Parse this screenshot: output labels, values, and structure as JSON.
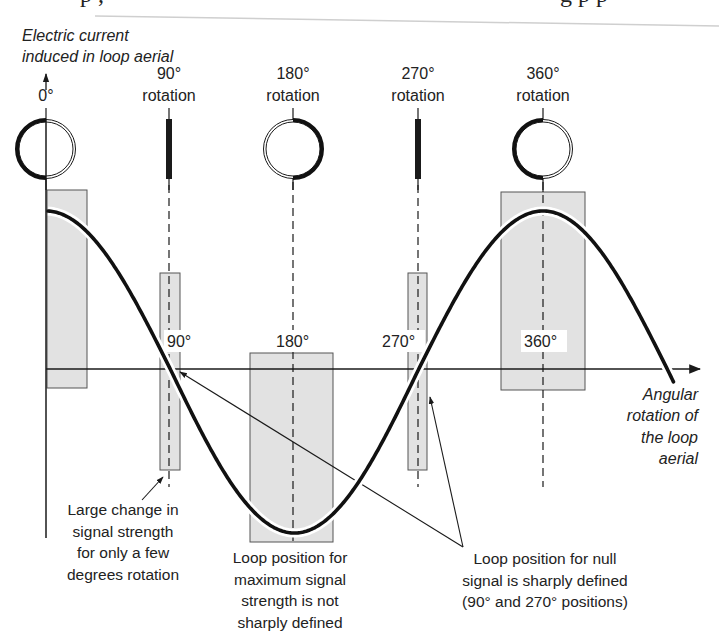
{
  "page_top_fragment": "p       ,                          g  p  p",
  "y_axis_label": {
    "line1": "Electric current",
    "line2": "induced in loop aerial"
  },
  "x_axis_label": {
    "line1": "Angular",
    "line2": "rotation of",
    "line3": "the loop",
    "line4": "aerial"
  },
  "loop_positions": [
    {
      "id": "0",
      "label_line1": "0°",
      "label_line2": "",
      "shape": "circle",
      "thick_side": "left"
    },
    {
      "id": "90",
      "label_line1": "90°",
      "label_line2": "rotation",
      "shape": "edge-on",
      "thick_side": "none"
    },
    {
      "id": "180",
      "label_line1": "180°",
      "label_line2": "rotation",
      "shape": "circle",
      "thick_side": "right"
    },
    {
      "id": "270",
      "label_line1": "270°",
      "label_line2": "rotation",
      "shape": "edge-on",
      "thick_side": "none"
    },
    {
      "id": "360",
      "label_line1": "360°",
      "label_line2": "rotation",
      "shape": "circle",
      "thick_side": "left"
    }
  ],
  "axis_tick_labels": [
    "90°",
    "180°",
    "270°",
    "360°"
  ],
  "annotations": {
    "large_change": {
      "line1": "Large change in",
      "line2": "signal strength",
      "line3": "for only a few",
      "line4": "degrees rotation"
    },
    "max_signal": {
      "line1": "Loop position for",
      "line2": "maximum signal",
      "line3": "strength is not",
      "line4": "sharply defined"
    },
    "null_signal": {
      "line1": "Loop position for null",
      "line2": "signal is sharply defined",
      "line3": "(90° and 270° positions)"
    }
  },
  "colors": {
    "ink": "#1a1a1a",
    "shade": "#e2e2e2",
    "background": "#ffffff"
  },
  "chart_data": {
    "type": "line",
    "title": "",
    "xlabel": "Angular rotation of the loop aerial",
    "ylabel": "Electric current induced in loop aerial",
    "x": [
      0,
      45,
      90,
      135,
      180,
      225,
      270,
      315,
      360,
      405,
      450
    ],
    "series": [
      {
        "name": "Induced current (cosine of rotation angle)",
        "values": [
          1,
          0.71,
          0,
          -0.71,
          -1,
          -0.71,
          0,
          0.71,
          1,
          0.71,
          0
        ]
      }
    ],
    "x_ticks": [
      "90°",
      "180°",
      "270°",
      "360°"
    ],
    "xlim": [
      0,
      455
    ],
    "ylim": [
      -1,
      1
    ],
    "highlight_bands": [
      {
        "center": "0°",
        "meaning": "max signal, broad"
      },
      {
        "center": "90°",
        "meaning": "null, sharp"
      },
      {
        "center": "180°",
        "meaning": "max signal, broad"
      },
      {
        "center": "270°",
        "meaning": "null, sharp"
      },
      {
        "center": "360°",
        "meaning": "max signal, broad"
      }
    ],
    "grid": false,
    "legend": "none"
  }
}
